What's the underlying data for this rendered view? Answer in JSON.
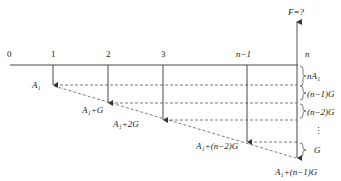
{
  "diagram": {
    "type": "cash-flow-diagram",
    "top_label": "F=?",
    "timeline": {
      "periods": [
        "0",
        "1",
        "2",
        "3",
        "n−1",
        "n"
      ]
    },
    "cash_flows": [
      {
        "period": "1",
        "label": "A₁"
      },
      {
        "period": "2",
        "label": "A₁+G"
      },
      {
        "period": "3",
        "label": "A₁+2G"
      },
      {
        "period": "n−1",
        "label": "A₁+(n−2)G"
      },
      {
        "period": "n",
        "label": "A₁+(n−1)G"
      }
    ],
    "brace_labels": [
      "nA₁",
      "(n−1)G",
      "(n−2)G",
      "⋮",
      "G"
    ]
  }
}
